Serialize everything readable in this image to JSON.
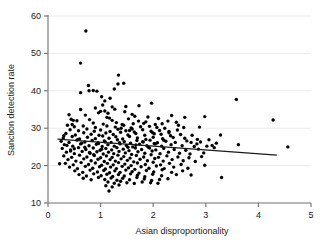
{
  "chart_data": {
    "type": "scatter",
    "title": "",
    "xlabel": "Asian disproportionality",
    "ylabel": "Sanction detection rate",
    "xlim": [
      0,
      5
    ],
    "ylim": [
      10,
      60
    ],
    "xticks": [
      0,
      1,
      2,
      3,
      4,
      5
    ],
    "yticks": [
      10,
      20,
      30,
      40,
      50,
      60
    ],
    "xticklabels": [
      "0",
      "1",
      "2",
      "3",
      "4",
      "5"
    ],
    "yticklabels": [
      "10",
      "20",
      "30",
      "40",
      "50",
      "60"
    ],
    "grid": "horizontal",
    "legend": "none",
    "marker_color": "#000000",
    "marker_size": 3.4,
    "axis_color": "#7a7a7a",
    "grid_color": "#ebebeb",
    "fit_line": {
      "type": "linear",
      "color": "#1a1a1a",
      "x_start": 0.18,
      "y_start": 27.1,
      "x_end": 4.35,
      "y_end": 22.8
    },
    "points": [
      [
        0.72,
        56.0
      ],
      [
        0.62,
        47.4
      ],
      [
        1.34,
        44.2
      ],
      [
        0.77,
        41.4
      ],
      [
        1.33,
        41.8
      ],
      [
        0.62,
        39.5
      ],
      [
        0.86,
        40.1
      ],
      [
        0.93,
        39.9
      ],
      [
        0.78,
        40.0
      ],
      [
        1.02,
        38.4
      ],
      [
        1.08,
        37.3
      ],
      [
        3.58,
        37.7
      ],
      [
        1.97,
        36.7
      ],
      [
        1.22,
        35.7
      ],
      [
        1.0,
        34.5
      ],
      [
        0.96,
        34.1
      ],
      [
        1.08,
        34.6
      ],
      [
        1.14,
        34.0
      ],
      [
        1.46,
        34.4
      ],
      [
        1.6,
        33.7
      ],
      [
        2.98,
        33.1
      ],
      [
        4.28,
        32.2
      ],
      [
        0.55,
        32.0
      ],
      [
        0.44,
        32.4
      ],
      [
        0.48,
        32.1
      ],
      [
        0.79,
        32.3
      ],
      [
        1.17,
        32.7
      ],
      [
        1.22,
        32.1
      ],
      [
        1.53,
        32.5
      ],
      [
        1.72,
        31.9
      ],
      [
        2.28,
        31.9
      ],
      [
        2.44,
        31.6
      ],
      [
        0.86,
        31.4
      ],
      [
        1.05,
        31.1
      ],
      [
        1.3,
        31.5
      ],
      [
        1.41,
        31.0
      ],
      [
        1.62,
        31.2
      ],
      [
        1.82,
        31.3
      ],
      [
        2.04,
        31.0
      ],
      [
        2.17,
        31.2
      ],
      [
        0.37,
        30.8
      ],
      [
        0.5,
        30.4
      ],
      [
        0.67,
        30.6
      ],
      [
        0.9,
        30.2
      ],
      [
        1.12,
        30.6
      ],
      [
        1.28,
        30.3
      ],
      [
        1.44,
        30.8
      ],
      [
        1.58,
        30.1
      ],
      [
        1.76,
        30.4
      ],
      [
        1.93,
        30.5
      ],
      [
        2.07,
        30.2
      ],
      [
        2.22,
        30.0
      ],
      [
        2.58,
        30.2
      ],
      [
        2.88,
        30.3
      ],
      [
        0.42,
        29.6
      ],
      [
        0.58,
        29.3
      ],
      [
        0.74,
        29.8
      ],
      [
        0.88,
        29.2
      ],
      [
        1.0,
        29.5
      ],
      [
        1.18,
        29.1
      ],
      [
        1.33,
        29.7
      ],
      [
        1.48,
        29.3
      ],
      [
        1.64,
        29.0
      ],
      [
        1.8,
        29.6
      ],
      [
        1.96,
        29.2
      ],
      [
        2.12,
        29.4
      ],
      [
        2.3,
        29.1
      ],
      [
        2.46,
        29.5
      ],
      [
        0.34,
        28.6
      ],
      [
        0.52,
        28.2
      ],
      [
        0.68,
        28.8
      ],
      [
        0.82,
        28.4
      ],
      [
        0.97,
        28.1
      ],
      [
        1.1,
        28.7
      ],
      [
        1.24,
        28.3
      ],
      [
        1.38,
        28.9
      ],
      [
        1.52,
        28.2
      ],
      [
        1.67,
        28.6
      ],
      [
        1.84,
        28.1
      ],
      [
        1.99,
        28.8
      ],
      [
        2.15,
        28.4
      ],
      [
        2.33,
        28.0
      ],
      [
        2.52,
        28.3
      ],
      [
        2.74,
        28.1
      ],
      [
        3.28,
        28.2
      ],
      [
        0.29,
        27.4
      ],
      [
        0.46,
        27.8
      ],
      [
        0.6,
        27.1
      ],
      [
        0.75,
        27.6
      ],
      [
        0.9,
        27.2
      ],
      [
        1.04,
        27.9
      ],
      [
        1.16,
        27.3
      ],
      [
        1.29,
        27.7
      ],
      [
        1.42,
        27.1
      ],
      [
        1.55,
        27.8
      ],
      [
        1.7,
        27.4
      ],
      [
        1.86,
        27.0
      ],
      [
        2.0,
        27.6
      ],
      [
        2.18,
        27.2
      ],
      [
        2.38,
        27.5
      ],
      [
        2.6,
        27.3
      ],
      [
        2.84,
        27.0
      ],
      [
        3.06,
        26.9
      ],
      [
        0.25,
        26.5
      ],
      [
        0.4,
        26.2
      ],
      [
        0.55,
        26.8
      ],
      [
        0.7,
        26.3
      ],
      [
        0.84,
        26.7
      ],
      [
        0.95,
        26.1
      ],
      [
        1.07,
        26.6
      ],
      [
        1.2,
        26.2
      ],
      [
        1.32,
        26.9
      ],
      [
        1.45,
        26.4
      ],
      [
        1.57,
        26.0
      ],
      [
        1.69,
        26.7
      ],
      [
        1.81,
        26.3
      ],
      [
        1.94,
        26.8
      ],
      [
        2.08,
        26.1
      ],
      [
        2.24,
        26.5
      ],
      [
        2.42,
        26.2
      ],
      [
        2.64,
        26.6
      ],
      [
        2.9,
        26.3
      ],
      [
        3.2,
        26.0
      ],
      [
        0.31,
        25.6
      ],
      [
        0.47,
        25.2
      ],
      [
        0.62,
        25.8
      ],
      [
        0.78,
        25.3
      ],
      [
        0.92,
        25.7
      ],
      [
        1.03,
        25.1
      ],
      [
        1.14,
        25.6
      ],
      [
        1.26,
        25.2
      ],
      [
        1.37,
        25.8
      ],
      [
        1.49,
        25.4
      ],
      [
        1.61,
        25.0
      ],
      [
        1.74,
        25.7
      ],
      [
        1.88,
        25.3
      ],
      [
        2.02,
        25.9
      ],
      [
        2.16,
        25.2
      ],
      [
        2.34,
        25.6
      ],
      [
        2.55,
        25.3
      ],
      [
        2.78,
        25.1
      ],
      [
        3.12,
        25.4
      ],
      [
        3.62,
        25.6
      ],
      [
        4.56,
        25.0
      ],
      [
        0.27,
        24.6
      ],
      [
        0.43,
        24.2
      ],
      [
        0.58,
        24.8
      ],
      [
        0.72,
        24.3
      ],
      [
        0.86,
        24.7
      ],
      [
        0.99,
        24.1
      ],
      [
        1.1,
        24.6
      ],
      [
        1.21,
        24.2
      ],
      [
        1.31,
        24.8
      ],
      [
        1.43,
        24.4
      ],
      [
        1.54,
        24.0
      ],
      [
        1.66,
        24.7
      ],
      [
        1.78,
        24.3
      ],
      [
        1.91,
        24.9
      ],
      [
        2.05,
        24.2
      ],
      [
        2.2,
        24.6
      ],
      [
        2.4,
        24.3
      ],
      [
        2.62,
        24.1
      ],
      [
        2.86,
        24.4
      ],
      [
        0.35,
        23.6
      ],
      [
        0.5,
        23.2
      ],
      [
        0.65,
        23.8
      ],
      [
        0.8,
        23.3
      ],
      [
        0.93,
        23.7
      ],
      [
        1.05,
        23.1
      ],
      [
        1.15,
        23.6
      ],
      [
        1.25,
        23.2
      ],
      [
        1.35,
        23.8
      ],
      [
        1.47,
        23.4
      ],
      [
        1.59,
        23.0
      ],
      [
        1.71,
        23.7
      ],
      [
        1.84,
        23.3
      ],
      [
        1.98,
        23.9
      ],
      [
        2.13,
        23.2
      ],
      [
        2.29,
        23.6
      ],
      [
        2.5,
        23.3
      ],
      [
        2.7,
        23.1
      ],
      [
        2.96,
        23.4
      ],
      [
        0.3,
        22.6
      ],
      [
        0.45,
        22.2
      ],
      [
        0.6,
        22.8
      ],
      [
        0.74,
        22.3
      ],
      [
        0.88,
        22.7
      ],
      [
        1.0,
        22.1
      ],
      [
        1.11,
        22.6
      ],
      [
        1.22,
        22.2
      ],
      [
        1.33,
        22.8
      ],
      [
        1.44,
        22.4
      ],
      [
        1.56,
        22.0
      ],
      [
        1.68,
        22.7
      ],
      [
        1.82,
        22.3
      ],
      [
        1.96,
        22.9
      ],
      [
        2.1,
        22.2
      ],
      [
        2.26,
        22.6
      ],
      [
        2.47,
        22.3
      ],
      [
        2.68,
        22.1
      ],
      [
        2.92,
        22.4
      ],
      [
        0.22,
        20.5
      ],
      [
        0.38,
        21.6
      ],
      [
        0.53,
        21.2
      ],
      [
        0.68,
        21.8
      ],
      [
        0.82,
        21.3
      ],
      [
        0.95,
        21.7
      ],
      [
        1.07,
        21.1
      ],
      [
        1.18,
        21.6
      ],
      [
        1.28,
        21.2
      ],
      [
        1.39,
        21.8
      ],
      [
        1.51,
        21.4
      ],
      [
        1.63,
        21.0
      ],
      [
        1.75,
        21.7
      ],
      [
        1.89,
        21.3
      ],
      [
        2.03,
        21.9
      ],
      [
        2.19,
        21.2
      ],
      [
        2.36,
        21.6
      ],
      [
        2.57,
        21.3
      ],
      [
        2.8,
        21.1
      ],
      [
        0.33,
        20.6
      ],
      [
        0.48,
        20.2
      ],
      [
        0.63,
        20.8
      ],
      [
        0.77,
        20.3
      ],
      [
        0.9,
        20.7
      ],
      [
        1.02,
        20.1
      ],
      [
        1.13,
        20.6
      ],
      [
        1.24,
        20.2
      ],
      [
        1.34,
        20.8
      ],
      [
        1.46,
        20.4
      ],
      [
        1.58,
        20.0
      ],
      [
        1.7,
        20.7
      ],
      [
        1.85,
        20.3
      ],
      [
        2.0,
        20.9
      ],
      [
        2.14,
        20.2
      ],
      [
        2.31,
        20.6
      ],
      [
        2.53,
        20.3
      ],
      [
        2.98,
        20.1
      ],
      [
        0.41,
        19.6
      ],
      [
        0.56,
        19.2
      ],
      [
        0.71,
        19.8
      ],
      [
        0.85,
        19.3
      ],
      [
        0.98,
        19.7
      ],
      [
        1.09,
        19.1
      ],
      [
        1.19,
        19.6
      ],
      [
        1.3,
        19.2
      ],
      [
        1.41,
        19.8
      ],
      [
        1.53,
        19.4
      ],
      [
        1.65,
        19.0
      ],
      [
        1.77,
        19.7
      ],
      [
        1.92,
        19.3
      ],
      [
        2.06,
        19.9
      ],
      [
        2.21,
        19.2
      ],
      [
        2.39,
        19.6
      ],
      [
        2.66,
        19.3
      ],
      [
        0.51,
        18.6
      ],
      [
        0.66,
        18.2
      ],
      [
        0.8,
        18.8
      ],
      [
        0.94,
        18.3
      ],
      [
        1.06,
        18.7
      ],
      [
        1.17,
        18.1
      ],
      [
        1.27,
        18.6
      ],
      [
        1.37,
        18.2
      ],
      [
        1.48,
        18.8
      ],
      [
        1.6,
        18.4
      ],
      [
        1.73,
        18.0
      ],
      [
        1.87,
        18.7
      ],
      [
        2.01,
        18.3
      ],
      [
        2.17,
        18.9
      ],
      [
        2.35,
        18.2
      ],
      [
        2.56,
        18.6
      ],
      [
        0.59,
        17.6
      ],
      [
        0.73,
        17.2
      ],
      [
        0.87,
        17.8
      ],
      [
        1.01,
        17.3
      ],
      [
        1.12,
        17.7
      ],
      [
        1.23,
        17.1
      ],
      [
        1.34,
        17.6
      ],
      [
        1.45,
        17.2
      ],
      [
        1.57,
        17.8
      ],
      [
        1.7,
        17.4
      ],
      [
        1.84,
        17.0
      ],
      [
        1.99,
        17.7
      ],
      [
        2.16,
        17.3
      ],
      [
        2.44,
        17.6
      ],
      [
        2.72,
        17.5
      ],
      [
        0.67,
        16.6
      ],
      [
        0.82,
        16.2
      ],
      [
        0.96,
        16.8
      ],
      [
        1.08,
        16.3
      ],
      [
        1.2,
        16.7
      ],
      [
        1.31,
        16.1
      ],
      [
        1.42,
        16.6
      ],
      [
        1.55,
        16.2
      ],
      [
        1.69,
        16.8
      ],
      [
        1.83,
        16.4
      ],
      [
        1.97,
        16.0
      ],
      [
        2.12,
        16.3
      ],
      [
        2.28,
        16.5
      ],
      [
        3.3,
        16.8
      ],
      [
        1.14,
        15.6
      ],
      [
        1.26,
        15.3
      ],
      [
        1.38,
        15.8
      ],
      [
        1.5,
        15.4
      ],
      [
        1.64,
        15.2
      ],
      [
        1.79,
        15.6
      ],
      [
        1.95,
        15.4
      ],
      [
        2.09,
        15.3
      ],
      [
        1.16,
        13.2
      ],
      [
        1.1,
        14.6
      ],
      [
        1.22,
        14.3
      ],
      [
        1.35,
        14.8
      ],
      [
        0.62,
        35.0
      ],
      [
        0.9,
        35.4
      ],
      [
        1.04,
        36.2
      ],
      [
        1.27,
        35.1
      ],
      [
        1.48,
        35.8
      ],
      [
        1.65,
        33.2
      ],
      [
        1.9,
        33.0
      ],
      [
        2.1,
        32.6
      ],
      [
        2.35,
        33.4
      ],
      [
        2.6,
        32.9
      ],
      [
        0.4,
        33.6
      ],
      [
        0.46,
        31.0
      ],
      [
        0.71,
        33.5
      ],
      [
        1.44,
        42.0
      ],
      [
        1.26,
        40.5
      ],
      [
        1.18,
        38.0
      ],
      [
        1.55,
        29.4
      ],
      [
        2.72,
        26.2
      ],
      [
        2.83,
        25.8
      ],
      [
        3.02,
        25.2
      ],
      [
        3.16,
        24.8
      ],
      [
        1.73,
        36.0
      ],
      [
        0.96,
        25.9
      ],
      [
        1.02,
        24.4
      ],
      [
        1.09,
        26.3
      ],
      [
        1.36,
        26.1
      ],
      [
        1.52,
        24.9
      ],
      [
        1.67,
        25.5
      ],
      [
        1.8,
        26.4
      ],
      [
        1.93,
        24.7
      ],
      [
        2.04,
        25.8
      ],
      [
        2.2,
        26.8
      ],
      [
        0.87,
        22.9
      ],
      [
        0.79,
        23.5
      ],
      [
        0.7,
        24.9
      ],
      [
        0.64,
        26.0
      ],
      [
        0.57,
        27.0
      ],
      [
        0.5,
        24.5
      ],
      [
        0.43,
        23.9
      ],
      [
        0.36,
        25.4
      ],
      [
        0.3,
        28.0
      ],
      [
        2.48,
        30.8
      ],
      [
        2.3,
        28.8
      ],
      [
        1.12,
        32.9
      ],
      [
        1.39,
        30.0
      ],
      [
        1.6,
        29.8
      ],
      [
        1.86,
        31.7
      ],
      [
        2.02,
        28.5
      ]
    ]
  }
}
